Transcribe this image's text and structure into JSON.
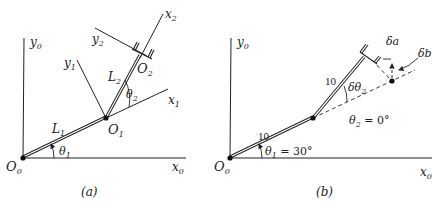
{
  "panel_a": {
    "caption": "(a)",
    "origin_label": "O",
    "origin_sub": "0",
    "x0_label": "x",
    "x0_sub": "0",
    "y0_label": "y",
    "y0_sub": "0",
    "link1_label": "L",
    "link1_sub": "1",
    "link2_label": "L",
    "link2_sub": "2",
    "joint1_label": "O",
    "joint1_sub": "1",
    "joint2_label": "O",
    "joint2_sub": "2",
    "x1_label": "x",
    "x1_sub": "1",
    "y1_label": "y",
    "y1_sub": "1",
    "x2_label": "x",
    "x2_sub": "2",
    "y2_label": "y",
    "y2_sub": "2",
    "theta1_label": "θ",
    "theta1_sub": "1",
    "theta2_label": "θ",
    "theta2_sub": "2"
  },
  "panel_b": {
    "caption": "(b)",
    "origin_label": "O",
    "origin_sub": "0",
    "x0_label": "x",
    "x0_sub": "0",
    "y0_label": "y",
    "y0_sub": "0",
    "link1_length": "10",
    "link2_length": "10",
    "theta1_text": "θ",
    "theta1_sub": "1",
    "theta1_value": " = 30°",
    "theta2_text": "θ",
    "theta2_sub": "2",
    "theta2_value": " = 0°",
    "dtheta2_text": "δθ",
    "dtheta2_sub": "2",
    "delta_a": "δa",
    "delta_b": "δb"
  }
}
